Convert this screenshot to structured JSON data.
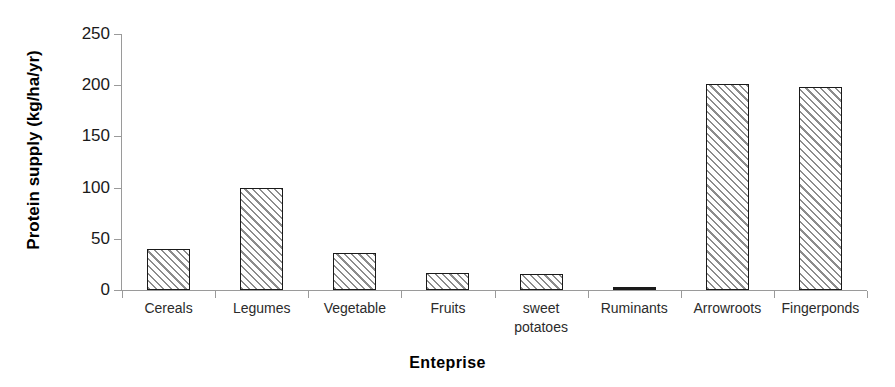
{
  "chart_data": {
    "type": "bar",
    "title": "",
    "xlabel": "Enteprise",
    "ylabel": "Protein supply (kg/ha/yr)",
    "categories": [
      "Cereals",
      "Legumes",
      "Vegetable",
      "Fruits",
      "sweet potatoes",
      "Ruminants",
      "Arrowroots",
      "Fingerponds"
    ],
    "values": [
      40,
      100,
      36,
      17,
      16,
      2,
      201,
      198
    ],
    "ylim": [
      0,
      250
    ],
    "yticks": [
      0,
      50,
      100,
      150,
      200,
      250
    ],
    "ytick_labels": [
      "0",
      "50",
      "100",
      "150",
      "200",
      "250"
    ],
    "grid": false,
    "legend": null,
    "series": [
      {
        "name": "Protein supply",
        "values": [
          40,
          100,
          36,
          17,
          16,
          2,
          201,
          198
        ]
      }
    ],
    "bar_style": {
      "fill": "diagonal-hatch",
      "hatch_color": "#8c8c8c",
      "edge_color": "#1a1a1a",
      "background": "#ffffff"
    }
  },
  "axis": {
    "line_color": "#9a9a9a"
  }
}
